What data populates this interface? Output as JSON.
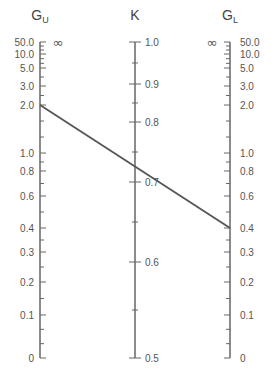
{
  "chart_data": {
    "type": "nomograph",
    "axes": [
      {
        "name": "G_U",
        "title_main": "G",
        "title_sub": "U",
        "x": 40,
        "tick_side": "right",
        "label_side": "left",
        "infinity_label": "∞",
        "ticks": [
          {
            "label": "50.0",
            "y": 42
          },
          {
            "label": "10.0",
            "y": 54
          },
          {
            "label": "5.0",
            "y": 68
          },
          {
            "label": "3.0",
            "y": 86
          },
          {
            "label": "2.0",
            "y": 105
          },
          {
            "label": "1.0",
            "y": 153
          },
          {
            "label": "0.8",
            "y": 171
          },
          {
            "label": "0.6",
            "y": 196
          },
          {
            "label": "0.4",
            "y": 228
          },
          {
            "label": "0.3",
            "y": 252
          },
          {
            "label": "0.2",
            "y": 282
          },
          {
            "label": "0.1",
            "y": 315
          },
          {
            "label": "0",
            "y": 358
          }
        ]
      },
      {
        "name": "K",
        "title_main": "K",
        "title_sub": "",
        "x": 135,
        "tick_side": "both",
        "label_side": "right",
        "ticks": [
          {
            "label": "1.0",
            "y": 42
          },
          {
            "label": "0.9",
            "y": 84
          },
          {
            "label": "0.8",
            "y": 122
          },
          {
            "label": "0.7",
            "y": 182
          },
          {
            "label": "0.6",
            "y": 262
          },
          {
            "label": "0.5",
            "y": 358
          }
        ]
      },
      {
        "name": "G_L",
        "title_main": "G",
        "title_sub": "L",
        "x": 230,
        "tick_side": "left",
        "label_side": "right",
        "infinity_label": "∞",
        "ticks": [
          {
            "label": "50.0",
            "y": 42
          },
          {
            "label": "10.0",
            "y": 54
          },
          {
            "label": "5.0",
            "y": 68
          },
          {
            "label": "3.0",
            "y": 86
          },
          {
            "label": "2.0",
            "y": 105
          },
          {
            "label": "1.0",
            "y": 153
          },
          {
            "label": "0.8",
            "y": 171
          },
          {
            "label": "0.6",
            "y": 196
          },
          {
            "label": "0.4",
            "y": 228
          },
          {
            "label": "0.3",
            "y": 252
          },
          {
            "label": "0.2",
            "y": 282
          },
          {
            "label": "0.1",
            "y": 315
          },
          {
            "label": "0",
            "y": 358
          }
        ]
      }
    ],
    "example_line": {
      "G_U": 2.0,
      "K_approx": 0.75,
      "G_L": 0.4,
      "from": [
        40,
        105
      ],
      "to": [
        230,
        228
      ]
    },
    "colors": {
      "axis": "#666666",
      "line": "#555555",
      "text": "#555555"
    }
  }
}
